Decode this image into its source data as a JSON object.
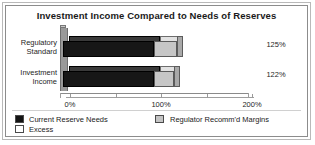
{
  "chart_data": {
    "type": "bar",
    "orientation": "horizontal",
    "title": "Investment Income Compared to Needs of Reserves",
    "xlabel": "",
    "ylabel": "",
    "categories": [
      "Regulatory Standard",
      "Investment Income"
    ],
    "category_lines": [
      [
        "Regulatory",
        "Standard"
      ],
      [
        "Investment",
        "Income"
      ]
    ],
    "series": [
      {
        "name": "Current Reserve Needs",
        "values": [
          100,
          100
        ],
        "color": "#171717"
      },
      {
        "name": "Regulator Recomm'd Margins",
        "values": [
          25,
          22
        ],
        "color": "#c6c6c6"
      }
    ],
    "totals": [
      125,
      122
    ],
    "value_labels": [
      "125%",
      "122%"
    ],
    "xlim": [
      0,
      200
    ],
    "major_ticks": [
      0,
      100,
      200
    ],
    "major_tick_labels": [
      "0%",
      "100%",
      "200%"
    ],
    "minor_ticks": [
      50,
      150
    ],
    "grid": false,
    "legend_position": "bottom",
    "legend": [
      {
        "label": "Current Reserve Needs",
        "swatch": "black"
      },
      {
        "label": "Excess",
        "swatch": "white"
      },
      {
        "label": "Regulator Recomm'd Margins",
        "swatch": "gray"
      }
    ]
  },
  "colors": {
    "bar_dark": "#171717",
    "bar_light": "#c6c6c6",
    "axis": "#8a8a8a",
    "frame": "#8c8c8c",
    "background": "#ffffff",
    "text": "#262626"
  }
}
